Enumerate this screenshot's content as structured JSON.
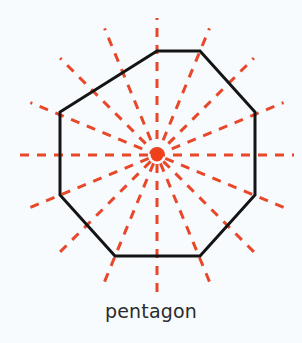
{
  "figure": {
    "label": "pentagon",
    "background_color": "#f7fbfd",
    "outline_color": "#141414",
    "symmetry_line_color": "#e8472a",
    "center_dot_color": "#f0401a",
    "label_color": "#2b2b2b"
  },
  "chart_data": {
    "type": "diagram",
    "title": "pentagon",
    "shape": {
      "name": "octagon",
      "sides": 8,
      "center": [
        157,
        155
      ],
      "circumradius": 109,
      "vertex_angles_deg": [
        22.5,
        67.5,
        112.5,
        157.5,
        202.5,
        247.5,
        292.5,
        337.5
      ],
      "vertices": [
        [
          157,
          51
        ],
        [
          200,
          51
        ],
        [
          255,
          112
        ],
        [
          255,
          195
        ],
        [
          200,
          256
        ],
        [
          115,
          256
        ],
        [
          60,
          195
        ],
        [
          60,
          112
        ]
      ],
      "stroke_width": 3,
      "stroke_color": "#141414",
      "fill": "none"
    },
    "symmetry_lines": {
      "count": 16,
      "angles_deg": [
        0,
        22.5,
        45,
        67.5,
        90,
        112.5,
        135,
        157.5,
        180,
        202.5,
        225,
        247.5,
        270,
        292.5,
        315,
        337.5
      ],
      "style": "dashed",
      "color": "#e8472a",
      "stroke_width": 3,
      "dash_pattern": "9 8",
      "length": 137,
      "note": "each drawn as a full diameter through the center, extending beyond the polygon edges"
    },
    "center_marker": {
      "type": "circle",
      "cx": 157,
      "cy": 155,
      "r": 6.5,
      "fill": "#f0401a"
    },
    "label_position": [
      157,
      311
    ]
  }
}
